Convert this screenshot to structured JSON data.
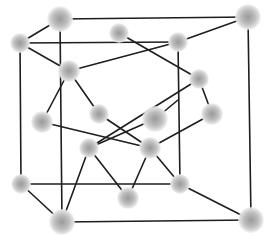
{
  "diagram": {
    "line_color": "#1e1e1e",
    "atom_center_color": "#9a9a9a",
    "atom_edge_color": "#f0f0f0",
    "atoms": [
      {
        "id": "back-top-left",
        "x": 60,
        "y": 19,
        "r": 13
      },
      {
        "id": "front-top-left",
        "x": 20,
        "y": 43,
        "r": 10
      },
      {
        "id": "top-face-center",
        "x": 119,
        "y": 33,
        "r": 10
      },
      {
        "id": "top-right-near",
        "x": 178,
        "y": 42,
        "r": 10
      },
      {
        "id": "back-top-right",
        "x": 248,
        "y": 17,
        "r": 13
      },
      {
        "id": "tet-upper-left",
        "x": 69,
        "y": 71,
        "r": 11
      },
      {
        "id": "right-upper",
        "x": 199,
        "y": 79,
        "r": 10
      },
      {
        "id": "right-lower",
        "x": 212,
        "y": 114,
        "r": 11
      },
      {
        "id": "left-face-center",
        "x": 42,
        "y": 122,
        "r": 11
      },
      {
        "id": "interior-upper",
        "x": 99,
        "y": 114,
        "r": 10
      },
      {
        "id": "center-face",
        "x": 155,
        "y": 119,
        "r": 13
      },
      {
        "id": "interior-lower-left",
        "x": 89,
        "y": 148,
        "r": 10
      },
      {
        "id": "interior-lower-right",
        "x": 150,
        "y": 148,
        "r": 11
      },
      {
        "id": "front-bottom-left",
        "x": 21,
        "y": 184,
        "r": 10
      },
      {
        "id": "bottom-front-corner",
        "x": 62,
        "y": 222,
        "r": 13
      },
      {
        "id": "bottom-center",
        "x": 128,
        "y": 198,
        "r": 11
      },
      {
        "id": "bottom-right-near",
        "x": 180,
        "y": 184,
        "r": 10
      },
      {
        "id": "bottom-right-corner",
        "x": 251,
        "y": 220,
        "r": 13
      }
    ],
    "cube_edges": [
      [
        60,
        19,
        248,
        17
      ],
      [
        20,
        43,
        178,
        42
      ],
      [
        20,
        43,
        21,
        184
      ],
      [
        60,
        19,
        62,
        222
      ],
      [
        248,
        17,
        251,
        220
      ],
      [
        178,
        42,
        180,
        184
      ],
      [
        21,
        184,
        180,
        184
      ],
      [
        62,
        222,
        251,
        220
      ]
    ],
    "bonds": [
      [
        60,
        19,
        20,
        43
      ],
      [
        20,
        43,
        69,
        71
      ],
      [
        178,
        42,
        69,
        71
      ],
      [
        178,
        42,
        248,
        17
      ],
      [
        119,
        33,
        199,
        79
      ],
      [
        69,
        71,
        42,
        122
      ],
      [
        69,
        71,
        99,
        114
      ],
      [
        199,
        79,
        212,
        114
      ],
      [
        199,
        79,
        89,
        148
      ],
      [
        212,
        114,
        150,
        148
      ],
      [
        155,
        119,
        178,
        100
      ],
      [
        42,
        122,
        150,
        148
      ],
      [
        99,
        114,
        150,
        148
      ],
      [
        155,
        119,
        89,
        148
      ],
      [
        89,
        148,
        62,
        222
      ],
      [
        89,
        148,
        128,
        198
      ],
      [
        150,
        148,
        128,
        198
      ],
      [
        150,
        148,
        180,
        184
      ],
      [
        21,
        184,
        62,
        222
      ],
      [
        180,
        184,
        251,
        220
      ]
    ]
  }
}
